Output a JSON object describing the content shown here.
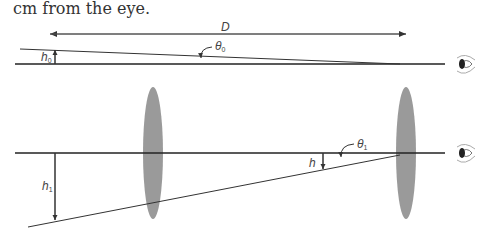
{
  "caption": "cm from the eye.",
  "labels": {
    "D": "D",
    "h0": "h",
    "h0_sub": "0",
    "theta0": "θ",
    "theta0_sub": "0",
    "h1": "h",
    "h1_sub": "1",
    "h": "h",
    "theta1": "θ",
    "theta1_sub": "1"
  },
  "colors": {
    "line": "#222222",
    "lens": "#9a9a9a",
    "text": "#444444"
  }
}
